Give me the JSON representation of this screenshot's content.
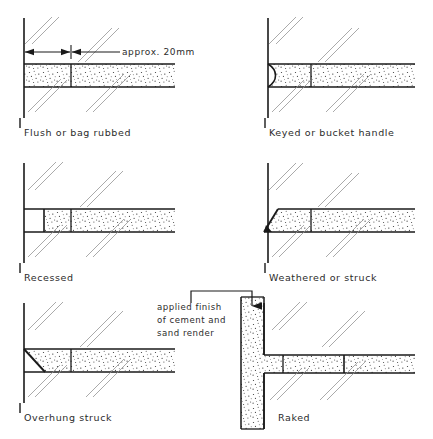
{
  "sheet": {
    "title": "Mortar joint profiles",
    "background": "#ffffff",
    "ink": "#1a1a1a",
    "hatch_color": "#8a8a8a",
    "stipple_color": "#3a3a3a"
  },
  "dimension": {
    "text": "approx. 20mm"
  },
  "annotation": {
    "line1": "applied finish",
    "line2": "of cement and",
    "line3": "sand render"
  },
  "details": [
    {
      "id": "flush",
      "label": "Flush or bag rubbed",
      "profile": "flush"
    },
    {
      "id": "keyed",
      "label": "Keyed or bucket handle",
      "profile": "concave"
    },
    {
      "id": "recessed",
      "label": "Recessed",
      "profile": "recessed"
    },
    {
      "id": "weathered",
      "label": "Weathered or struck",
      "profile": "weathered"
    },
    {
      "id": "overhung",
      "label": "Overhung struck",
      "profile": "overhung"
    },
    {
      "id": "raked",
      "label": "Raked",
      "profile": "raked"
    }
  ]
}
